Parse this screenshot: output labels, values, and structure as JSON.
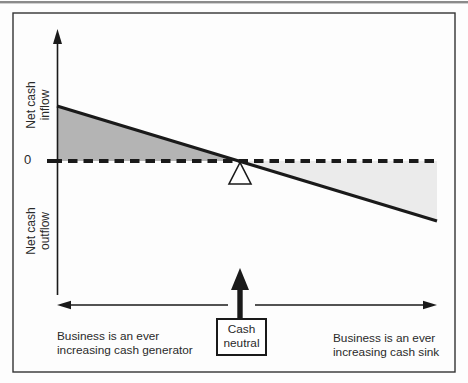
{
  "diagram": {
    "title_implicit": "Cash balance see-saw diagram",
    "axis": {
      "inflow_label": "Net cash\ninflow",
      "outflow_label": "Net cash\noutflow",
      "zero_label": "0"
    },
    "notes": {
      "left": "Business is an ever\nincreasing cash generator",
      "right": "Business is an ever\nincreasing cash sink",
      "center_box": "Cash\nneutral"
    },
    "colors": {
      "generator_region_fill": "#b4b4b4",
      "sink_region_fill": "#ebebeb",
      "ink": "#1a1a1a",
      "page_edge": "#8a8a8a",
      "box_fill": "#ffffff"
    }
  }
}
